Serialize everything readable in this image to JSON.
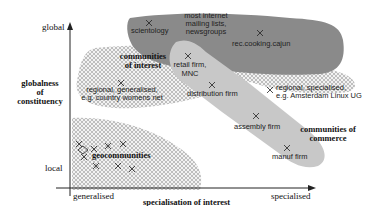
{
  "axes": {
    "y_top": "global",
    "y_bottom": "local",
    "y_title_lines": [
      "globalness",
      "of",
      "constituency"
    ],
    "x_left": "generalised",
    "x_right": "specialised",
    "x_title": "specialisation of interest"
  },
  "regions": {
    "communities_of_interest": [
      "communities",
      "of interest"
    ],
    "geocommunities": "geocommunities",
    "communities_of_commerce": [
      "communities of",
      "commerce"
    ]
  },
  "points": {
    "scientology": "scientology",
    "internet": [
      "most internet",
      "mailing lists,",
      "newsgroups"
    ],
    "rec_cooking": "rec.cooking.cajun",
    "retail": [
      "retail firm,",
      "MNC"
    ],
    "regional_generalised": [
      "regional, generalised,",
      "e.g. country womens net"
    ],
    "distribution": "distribution firm",
    "regional_specialised": [
      "regional, specialised,",
      "e.g. Amsterdam Linux UG"
    ],
    "assembly": "assembly firm",
    "manuf": "manuf firm"
  },
  "colors": {
    "dark_region": "#8a8a8a",
    "light_region": "#c8c8c8",
    "hatch": "#a8a8a8",
    "axis": "#222222"
  }
}
